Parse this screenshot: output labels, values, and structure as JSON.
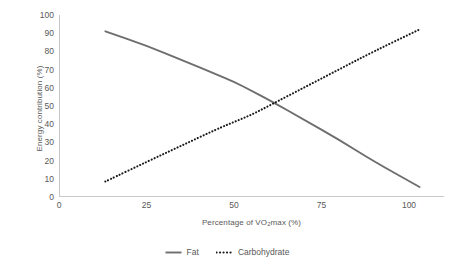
{
  "chart_data": {
    "type": "line",
    "title": "",
    "subtitle": "",
    "xlabel_prefix": "Percentage of VO",
    "xlabel_sub": "2",
    "xlabel_suffix": "max (%)",
    "xlabel": "Percentage of VO2max (%)",
    "ylabel": "Energy contribution (%)",
    "xlim": [
      0,
      110
    ],
    "ylim": [
      0,
      100
    ],
    "grid": false,
    "legend_position": "bottom-center",
    "x_ticks": [
      0,
      25,
      50,
      75,
      100
    ],
    "x_tick_labels": [
      "0",
      "25",
      "50",
      "75",
      "100"
    ],
    "y_ticks": [
      0,
      10,
      20,
      30,
      40,
      50,
      60,
      70,
      80,
      90,
      100
    ],
    "y_tick_labels": [
      "0",
      "10",
      "20",
      "30",
      "40",
      "50",
      "60",
      "70",
      "80",
      "90",
      "100"
    ],
    "series": [
      {
        "name": "Fat",
        "style": "solid",
        "color": "#6e6e6e",
        "x": [
          13,
          25,
          35,
          45,
          50,
          55,
          60,
          70,
          80,
          90,
          103
        ],
        "values": [
          91,
          83,
          75,
          67,
          63,
          58,
          53,
          42,
          31,
          19,
          5
        ]
      },
      {
        "name": "Carbohydrate",
        "style": "dotted",
        "color": "#1a1a1a",
        "x": [
          13,
          25,
          35,
          45,
          50,
          55,
          60,
          70,
          80,
          90,
          103
        ],
        "values": [
          8,
          19,
          28,
          37,
          41,
          45,
          50,
          60,
          70,
          80,
          92
        ]
      }
    ]
  },
  "legend": {
    "items": [
      {
        "label": "Fat",
        "style": "solid",
        "color": "#6e6e6e"
      },
      {
        "label": "Carbohydrate",
        "style": "dotted",
        "color": "#1a1a1a"
      }
    ]
  },
  "axes": {
    "axis_line_color": "#c9c9c9",
    "tick_text_color": "#595959"
  }
}
